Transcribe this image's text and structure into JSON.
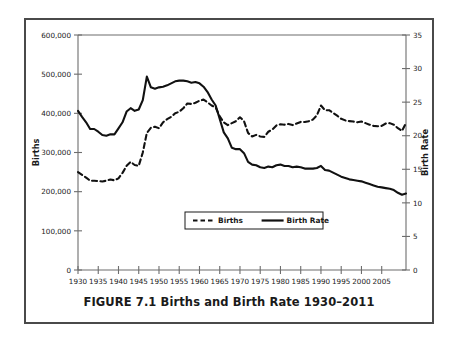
{
  "figure": {
    "caption": "FIGURE 7.1 Births and Birth Rate 1930–2011"
  },
  "chart_data": {
    "type": "line",
    "title": "",
    "xlabel": "Year",
    "ylabel": "Births",
    "y2label": "Birth Rate",
    "xlim": [
      1930,
      2011
    ],
    "ylim": [
      0,
      600000
    ],
    "y2lim": [
      0,
      35
    ],
    "grid": false,
    "legend_position": "bottom-center",
    "x_ticks": [
      1930,
      1935,
      1940,
      1945,
      1950,
      1955,
      1960,
      1965,
      1970,
      1975,
      1980,
      1985,
      1990,
      1995,
      2000,
      2005
    ],
    "x_tick_labels": [
      "1930",
      "1935",
      "1940",
      "1945",
      "1950",
      "1955",
      "1960",
      "1965",
      "1970",
      "1975",
      "1980",
      "1985",
      "1990",
      "1995",
      "2000",
      "2005"
    ],
    "y_ticks": [
      0,
      100000,
      200000,
      300000,
      400000,
      500000,
      600000
    ],
    "y_tick_labels": [
      "0",
      "100,000",
      "200,000",
      "300,000",
      "400,000",
      "500,000",
      "600,000"
    ],
    "y2_ticks": [
      0,
      5,
      10,
      15,
      20,
      25,
      30,
      35
    ],
    "y2_tick_labels": [
      "0",
      "5",
      "10",
      "15",
      "20",
      "25",
      "30",
      "35"
    ],
    "x": [
      1930,
      1931,
      1932,
      1933,
      1934,
      1935,
      1936,
      1937,
      1938,
      1939,
      1940,
      1941,
      1942,
      1943,
      1944,
      1945,
      1946,
      1947,
      1948,
      1949,
      1950,
      1951,
      1952,
      1953,
      1954,
      1955,
      1956,
      1957,
      1958,
      1959,
      1960,
      1961,
      1962,
      1963,
      1964,
      1965,
      1966,
      1967,
      1968,
      1969,
      1970,
      1971,
      1972,
      1973,
      1974,
      1975,
      1976,
      1977,
      1978,
      1979,
      1980,
      1981,
      1982,
      1983,
      1984,
      1985,
      1986,
      1987,
      1988,
      1989,
      1990,
      1991,
      1992,
      1993,
      1994,
      1995,
      1996,
      1997,
      1998,
      1999,
      2000,
      2001,
      2002,
      2003,
      2004,
      2005,
      2006,
      2007,
      2008,
      2009,
      2010,
      2011
    ],
    "series": [
      {
        "name": "Births",
        "axis": "left",
        "style": "dashed",
        "units": "births",
        "values": [
          250000,
          243000,
          236000,
          228000,
          228000,
          227000,
          226000,
          228000,
          231000,
          229000,
          234000,
          248000,
          266000,
          276000,
          268000,
          266000,
          300000,
          350000,
          363000,
          366000,
          362000,
          377000,
          385000,
          391000,
          400000,
          404000,
          413000,
          425000,
          424000,
          427000,
          432000,
          435000,
          428000,
          420000,
          415000,
          392000,
          377000,
          370000,
          375000,
          380000,
          390000,
          380000,
          350000,
          341000,
          345000,
          341000,
          340000,
          353000,
          359000,
          369000,
          372000,
          371000,
          373000,
          370000,
          374000,
          378000,
          378000,
          380000,
          384000,
          395000,
          420000,
          408000,
          408000,
          401000,
          394000,
          386000,
          382000,
          380000,
          379000,
          377000,
          379000,
          375000,
          371000,
          368000,
          367000,
          368000,
          374000,
          375000,
          371000,
          362000,
          355000,
          375000
        ]
      },
      {
        "name": "Birth Rate",
        "axis": "right",
        "style": "solid",
        "units": "per 1,000 population",
        "values": [
          23.7,
          22.8,
          22.0,
          21.0,
          21.0,
          20.6,
          20.1,
          20.0,
          20.2,
          20.2,
          21.1,
          22.0,
          23.6,
          24.1,
          23.7,
          23.9,
          25.3,
          28.8,
          27.2,
          27.0,
          27.2,
          27.3,
          27.5,
          27.8,
          28.1,
          28.2,
          28.2,
          28.1,
          27.9,
          28.0,
          27.8,
          27.3,
          26.5,
          25.4,
          24.5,
          22.5,
          20.5,
          19.6,
          18.2,
          18.0,
          18.0,
          17.4,
          16.1,
          15.7,
          15.6,
          15.3,
          15.2,
          15.4,
          15.3,
          15.6,
          15.7,
          15.5,
          15.5,
          15.3,
          15.4,
          15.3,
          15.1,
          15.1,
          15.1,
          15.2,
          15.5,
          14.9,
          14.8,
          14.5,
          14.2,
          13.9,
          13.7,
          13.5,
          13.4,
          13.3,
          13.2,
          13.0,
          12.8,
          12.6,
          12.4,
          12.3,
          12.2,
          12.1,
          11.9,
          11.5,
          11.2,
          11.4
        ]
      }
    ]
  },
  "legend": {
    "items": [
      {
        "label": "Births",
        "style": "dashed"
      },
      {
        "label": "Birth Rate",
        "style": "solid"
      }
    ]
  }
}
